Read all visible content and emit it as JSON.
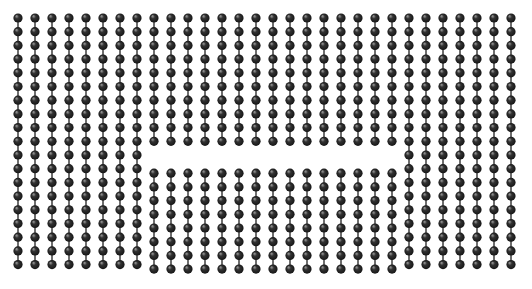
{
  "figure": {
    "title": "Particle lattice with horizontal stacking-fault defect",
    "background_color": "#ffffff",
    "width": 532,
    "height": 289
  },
  "lattice": {
    "type": "scatter",
    "particle_label": "particle",
    "bond_label": "bond",
    "columns": 30,
    "rows": 19,
    "origin_x": 18,
    "origin_y": 18,
    "column_spacing": 17.0,
    "row_spacing": 13.7,
    "particle_radius": 4.6,
    "particle_color": "#333333",
    "particle_color_dark": "#141414",
    "particle_highlight_color": "#8a8a8a",
    "bond_color": "#4a4a4a",
    "bond_width": 1.6
  },
  "defect": {
    "name": "horizontal-stacking-fault",
    "label": "stacking fault",
    "start_column": 8,
    "end_column": 22,
    "fault_row": 10,
    "y_center": 153,
    "gap_height": 9,
    "shift_below": 4.5,
    "description": "A missing / displaced row of particles across the central columns, producing a visible horizontal break in the otherwise regular lattice."
  },
  "chart_data": {
    "type": "scatter",
    "title": "Particle lattice with horizontal stacking-fault defect",
    "xlabel": "",
    "ylabel": "",
    "grid": false,
    "legend": "none",
    "xlim": [
      0,
      532
    ],
    "ylim": [
      0,
      289
    ],
    "series": [
      {
        "name": "lattice particles",
        "marker": "filled circle",
        "color": "#333333",
        "count": 559,
        "columns": 30,
        "rows_per_column": 19,
        "note": "Regular rectangular array; central columns 8-22 lose one row at the fault plane."
      },
      {
        "name": "interparticle bonds",
        "marker": "vertical line segment",
        "color": "#4a4a4a",
        "note": "Thin vertical bonds connect consecutive particles within each column; bonds are absent across the fault plane."
      }
    ]
  }
}
